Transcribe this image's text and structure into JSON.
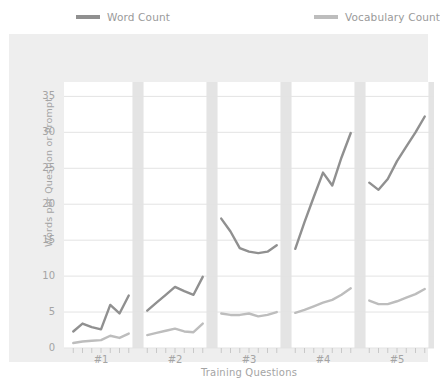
{
  "legend": {
    "position": "top",
    "entries": [
      {
        "label": "Word Count",
        "color": "#909090",
        "icon": "line-swatch"
      },
      {
        "label": "Vocabulary Count",
        "color": "#bdbdbd",
        "icon": "line-swatch"
      }
    ]
  },
  "axes": {
    "y_title": "Words per Question or Prompt",
    "x_title": "Training Questions",
    "y_ticks": [
      "0",
      "5",
      "10",
      "15",
      "20",
      "25",
      "30",
      "35"
    ],
    "x_ticks": [
      "#1",
      "#2",
      "#3",
      "#4",
      "#5"
    ]
  },
  "colors": {
    "panel_background": "#eeeeee",
    "plot_background": "#ffffff",
    "grid": "#e3e3e3",
    "band": "#e4e4e4",
    "tick_text": "#a4a4a4",
    "word_count": "#909090",
    "vocabulary_count": "#bdbdbd"
  },
  "chart_data": {
    "type": "line",
    "title": "",
    "subtitle": "",
    "xlabel": "Training Questions",
    "ylabel": "Words per Question or Prompt",
    "ylim": [
      0,
      37
    ],
    "xlim": [
      0,
      40
    ],
    "grid": true,
    "legend_position": "top",
    "x_tick_labels": [
      "#1",
      "#2",
      "#3",
      "#4",
      "#5"
    ],
    "x_tick_positions": [
      4,
      12,
      20,
      28,
      36
    ],
    "separator_bands": [
      {
        "start": 7.4,
        "end": 8.6
      },
      {
        "start": 15.4,
        "end": 16.6
      },
      {
        "start": 23.4,
        "end": 24.6
      },
      {
        "start": 31.4,
        "end": 32.6
      },
      {
        "start": 39.4,
        "end": 40.0
      }
    ],
    "series": [
      {
        "name": "Word Count",
        "color": "#909090",
        "segments": [
          {
            "x": [
              1,
              2,
              3,
              4,
              5,
              6,
              7
            ],
            "values": [
              2.3,
              3.4,
              2.9,
              2.6,
              6.0,
              4.8,
              7.3
            ]
          },
          {
            "x": [
              9,
              10,
              11,
              12,
              13,
              14,
              15
            ],
            "values": [
              5.2,
              6.3,
              7.4,
              8.5,
              7.9,
              7.4,
              9.9
            ]
          },
          {
            "x": [
              17,
              18,
              19,
              20,
              21,
              22,
              23
            ],
            "values": [
              18.0,
              16.2,
              13.9,
              13.4,
              13.2,
              13.4,
              14.3
            ]
          },
          {
            "x": [
              25,
              26,
              27,
              28,
              29,
              30,
              31
            ],
            "values": [
              13.8,
              17.5,
              21.0,
              24.4,
              22.6,
              26.5,
              29.9
            ]
          },
          {
            "x": [
              33,
              34,
              35,
              36,
              37,
              38,
              39
            ],
            "values": [
              23.0,
              22.0,
              23.5,
              26.0,
              28.0,
              30.0,
              32.2
            ]
          }
        ]
      },
      {
        "name": "Vocabulary Count",
        "color": "#bdbdbd",
        "segments": [
          {
            "x": [
              1,
              2,
              3,
              4,
              5,
              6,
              7
            ],
            "values": [
              0.7,
              0.9,
              1.0,
              1.1,
              1.7,
              1.4,
              2.0
            ]
          },
          {
            "x": [
              9,
              10,
              11,
              12,
              13,
              14,
              15
            ],
            "values": [
              1.8,
              2.1,
              2.4,
              2.7,
              2.3,
              2.2,
              3.4
            ]
          },
          {
            "x": [
              17,
              18,
              19,
              20,
              21,
              22,
              23
            ],
            "values": [
              4.8,
              4.6,
              4.6,
              4.8,
              4.4,
              4.6,
              5.0
            ]
          },
          {
            "x": [
              25,
              26,
              27,
              28,
              29,
              30,
              31
            ],
            "values": [
              4.9,
              5.3,
              5.8,
              6.3,
              6.7,
              7.4,
              8.3
            ]
          },
          {
            "x": [
              33,
              34,
              35,
              36,
              37,
              38,
              39
            ],
            "values": [
              6.6,
              6.1,
              6.1,
              6.5,
              7.0,
              7.5,
              8.2
            ]
          }
        ]
      }
    ]
  }
}
